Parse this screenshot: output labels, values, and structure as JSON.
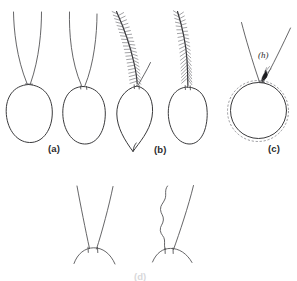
{
  "figure": {
    "kind": "line-drawing-plate",
    "background_color": "#ffffff",
    "ink_color": "#3a3a3c",
    "accent_color": "#1d1d20",
    "dash_color": "#7d7d83"
  },
  "panel_labels": {
    "a": "(a)",
    "b": "(b)",
    "c": "(c)",
    "d_partial": "(d)"
  },
  "part_labels": {
    "h": "(h)"
  },
  "top_row": {
    "items": [
      {
        "id": "fig-1",
        "name": "bare-antennae-oval-body",
        "antenna_type": "bare",
        "body_shape": "oval",
        "antenna_count": 2
      },
      {
        "id": "fig-2",
        "name": "bare-antennae-oval-body-2",
        "antenna_type": "bare",
        "body_shape": "oval",
        "antenna_count": 2
      },
      {
        "id": "fig-3",
        "name": "plumose-antenna-pointed-body",
        "antenna_type": "plumose",
        "body_shape": "teardrop-pointed",
        "antenna_count": 2
      },
      {
        "id": "fig-4",
        "name": "plumose-antenna-oval-body",
        "antenna_type": "plumose",
        "body_shape": "oval",
        "antenna_count": 1
      },
      {
        "id": "fig-5",
        "name": "tufted-antennae-circular-body",
        "antenna_type": "tufted",
        "body_shape": "circle-with-dashed-ring",
        "antenna_count": 2
      }
    ]
  },
  "bottom_row": {
    "items": [
      {
        "id": "fig-6",
        "name": "straight-antennae-arched-base",
        "antenna_type": "straight",
        "base_shape": "arch",
        "antenna_count": 2
      },
      {
        "id": "fig-7",
        "name": "wavy-antenna-arched-base",
        "antenna_type": "one-wavy-one-straight",
        "base_shape": "arch",
        "antenna_count": 2
      }
    ]
  }
}
